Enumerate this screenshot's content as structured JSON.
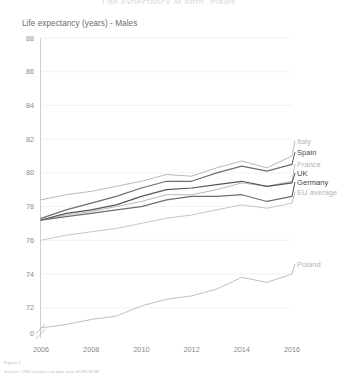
{
  "cut_title": "Life expectancy at birth, males",
  "footnote": {
    "figure_label": "Figure 1",
    "source": "Source: ONS analysis of data from EUROSTAT"
  },
  "chart_data": {
    "type": "line",
    "title": "Life expectancy (years) - Males",
    "xlabel": "",
    "ylabel": "",
    "grid": true,
    "legend_position": "right-inline",
    "axis_break": true,
    "x": [
      2006,
      2007,
      2008,
      2009,
      2010,
      2011,
      2012,
      2013,
      2014,
      2015,
      2016
    ],
    "xticks": [
      2006,
      2008,
      2010,
      2012,
      2014,
      2016
    ],
    "xtick_labels": [
      "2006",
      "2008",
      "2010",
      "2012",
      "2014",
      "2016"
    ],
    "yticks": [
      0,
      72,
      74,
      76,
      78,
      80,
      82,
      84,
      86,
      88
    ],
    "ytick_labels": [
      "0",
      "72",
      "74",
      "76",
      "78",
      "80",
      "82",
      "84",
      "86",
      "88"
    ],
    "ylim": [
      70.2,
      88
    ],
    "series": [
      {
        "name": "Italy",
        "color": "#b4b4b4",
        "values": [
          78.4,
          78.7,
          78.9,
          79.2,
          79.5,
          79.9,
          79.8,
          80.3,
          80.7,
          80.3,
          81.0
        ]
      },
      {
        "name": "Spain",
        "color": "#6e6e6e",
        "values": [
          77.3,
          77.8,
          78.2,
          78.6,
          79.1,
          79.5,
          79.5,
          80.0,
          80.4,
          80.1,
          80.5
        ]
      },
      {
        "name": "France",
        "color": "#b4b4b4",
        "values": [
          77.2,
          77.5,
          77.7,
          78.0,
          78.3,
          78.7,
          78.7,
          79.0,
          79.4,
          79.2,
          79.5
        ]
      },
      {
        "name": "UK",
        "color": "#555555",
        "values": [
          77.2,
          77.6,
          77.8,
          78.1,
          78.6,
          79.0,
          79.1,
          79.3,
          79.5,
          79.2,
          79.4
        ]
      },
      {
        "name": "Germany",
        "color": "#6e6e6e",
        "values": [
          77.2,
          77.4,
          77.6,
          77.8,
          78.0,
          78.4,
          78.6,
          78.6,
          78.7,
          78.3,
          78.6
        ]
      },
      {
        "name": "EU average",
        "color": "#c4c4c4",
        "values": [
          76.0,
          76.3,
          76.5,
          76.7,
          77.0,
          77.3,
          77.5,
          77.8,
          78.1,
          77.9,
          78.2
        ]
      },
      {
        "name": "Poland",
        "color": "#bdbdbd",
        "values": [
          70.8,
          71.0,
          71.3,
          71.5,
          72.1,
          72.5,
          72.7,
          73.1,
          73.8,
          73.5,
          74.0
        ]
      }
    ]
  },
  "legend": [
    {
      "label": "Italy",
      "color": "#b4b4b4"
    },
    {
      "label": "Spain",
      "color": "#4a4a4a"
    },
    {
      "label": "France",
      "color": "#b4b4b4"
    },
    {
      "label": "UK",
      "color": "#3f3f3f"
    },
    {
      "label": "Germany",
      "color": "#3f3f3f"
    },
    {
      "label": "EU average",
      "color": "#b4b4b4"
    },
    {
      "label": "Poland",
      "color": "#b4b4b4"
    }
  ]
}
